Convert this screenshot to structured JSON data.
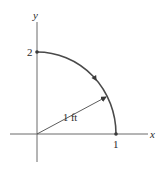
{
  "figure": {
    "axes": {
      "x_label": "x",
      "y_label": "y",
      "x_tick": "1",
      "y_tick": "2"
    },
    "path": {
      "description": "quarter elliptical path from (1,0) to (0,2), direction counterclockwise",
      "start": [
        1,
        0
      ],
      "end": [
        0,
        2
      ],
      "direction_arrow": "counterclockwise"
    },
    "radius_label": "1 ft",
    "colors": {
      "axis": "#6a6a6a",
      "curve": "#4a4a4a",
      "text": "#2a2a2a"
    }
  }
}
